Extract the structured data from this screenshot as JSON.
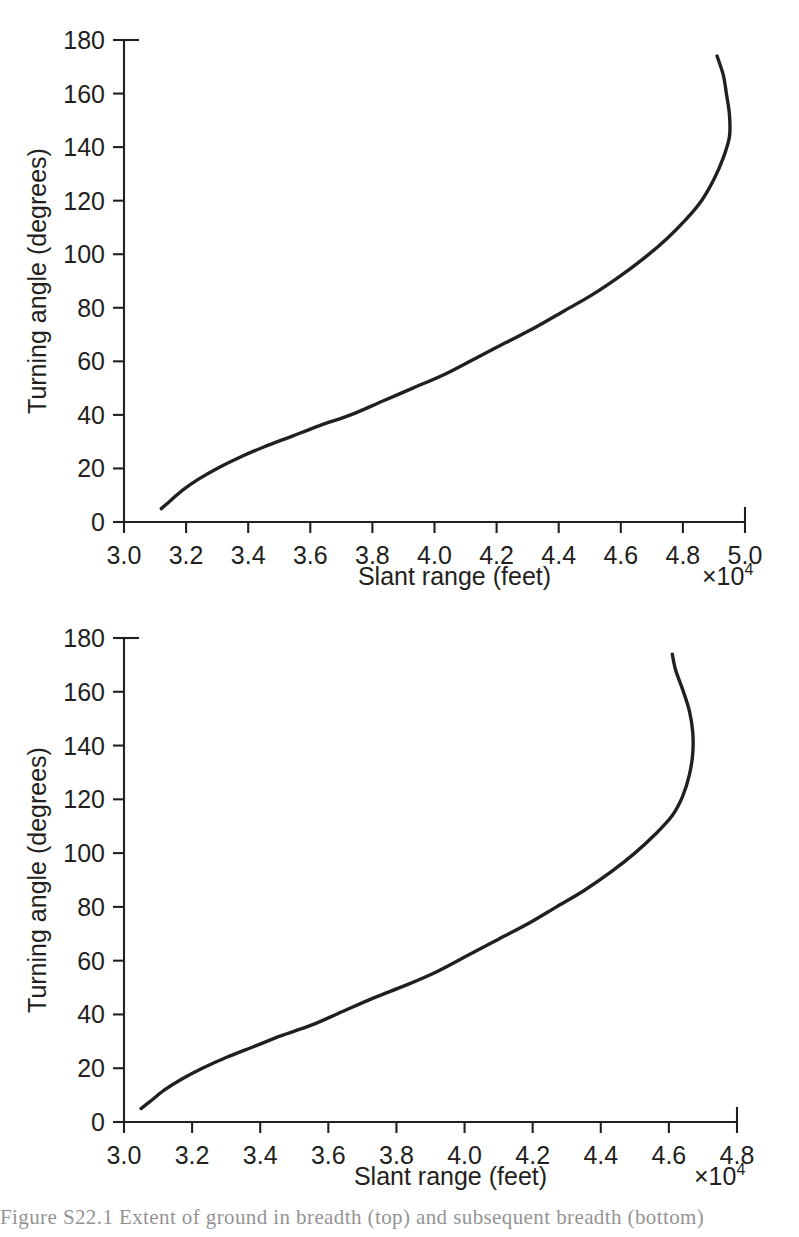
{
  "figure": {
    "caption": "Figure S22.1  Extent of ground in breadth (top) and subsequent breadth (bottom)"
  },
  "panels": [
    {
      "id": "top",
      "x_label": "Slant range (feet)",
      "y_label": "Turning angle (degrees)",
      "x_multiplier": "×10",
      "x_multiplier_exp": "4",
      "x_ticks": [
        "3.0",
        "3.2",
        "3.4",
        "3.6",
        "3.8",
        "4.0",
        "4.2",
        "4.4",
        "4.6",
        "4.8",
        "5.0"
      ],
      "y_ticks": [
        "0",
        "20",
        "40",
        "60",
        "80",
        "100",
        "120",
        "140",
        "160",
        "180"
      ]
    },
    {
      "id": "bottom",
      "x_label": "Slant range (feet)",
      "y_label": "Turning angle (degrees)",
      "x_multiplier": "×10",
      "x_multiplier_exp": "4",
      "x_ticks": [
        "3.0",
        "3.2",
        "3.4",
        "3.6",
        "3.8",
        "4.0",
        "4.2",
        "4.4",
        "4.6",
        "4.8"
      ],
      "y_ticks": [
        "0",
        "20",
        "40",
        "60",
        "80",
        "100",
        "120",
        "140",
        "160",
        "180"
      ]
    }
  ],
  "chart_data": [
    {
      "type": "line",
      "title": "",
      "panel": "top",
      "xlabel": "Slant range (feet)",
      "ylabel": "Turning angle (degrees)",
      "x_multiplier": 10000,
      "xlim": [
        3.0,
        5.0
      ],
      "ylim": [
        0,
        180
      ],
      "xticks": [
        3.0,
        3.2,
        3.4,
        3.6,
        3.8,
        4.0,
        4.2,
        4.4,
        4.6,
        4.8,
        5.0
      ],
      "yticks": [
        0,
        20,
        40,
        60,
        80,
        100,
        120,
        140,
        160,
        180
      ],
      "grid": false,
      "legend": null,
      "series": [
        {
          "name": "turning angle vs slant range",
          "x": [
            3.12,
            3.15,
            3.19,
            3.24,
            3.3,
            3.37,
            3.45,
            3.54,
            3.63,
            3.73,
            3.83,
            3.93,
            4.03,
            4.13,
            4.23,
            4.33,
            4.42,
            4.51,
            4.6,
            4.68,
            4.75,
            4.81,
            4.86,
            4.9,
            4.93,
            4.95,
            4.95,
            4.94,
            4.93,
            4.91
          ],
          "y": [
            5,
            8,
            12,
            16,
            20,
            24,
            28,
            32,
            36,
            40,
            45,
            50,
            55,
            61,
            67,
            73,
            79,
            85,
            92,
            99,
            106,
            113,
            120,
            128,
            136,
            144,
            152,
            160,
            167,
            174
          ]
        }
      ]
    },
    {
      "type": "line",
      "title": "",
      "panel": "bottom",
      "xlabel": "Slant range (feet)",
      "ylabel": "Turning angle (degrees)",
      "x_multiplier": 10000,
      "xlim": [
        3.0,
        4.8
      ],
      "ylim": [
        0,
        180
      ],
      "xticks": [
        3.0,
        3.2,
        3.4,
        3.6,
        3.8,
        4.0,
        4.2,
        4.4,
        4.6,
        4.8
      ],
      "yticks": [
        0,
        20,
        40,
        60,
        80,
        100,
        120,
        140,
        160,
        180
      ],
      "grid": false,
      "legend": null,
      "series": [
        {
          "name": "turning angle vs slant range",
          "x": [
            3.05,
            3.08,
            3.12,
            3.17,
            3.23,
            3.3,
            3.38,
            3.46,
            3.55,
            3.64,
            3.73,
            3.83,
            3.92,
            4.01,
            4.1,
            4.19,
            4.27,
            4.35,
            4.43,
            4.5,
            4.56,
            4.61,
            4.64,
            4.66,
            4.67,
            4.67,
            4.66,
            4.64,
            4.62,
            4.61
          ],
          "y": [
            5,
            8,
            12,
            16,
            20,
            24,
            28,
            32,
            36,
            41,
            46,
            51,
            56,
            62,
            68,
            74,
            80,
            86,
            93,
            100,
            107,
            114,
            121,
            129,
            137,
            145,
            153,
            161,
            168,
            174
          ]
        }
      ]
    }
  ]
}
